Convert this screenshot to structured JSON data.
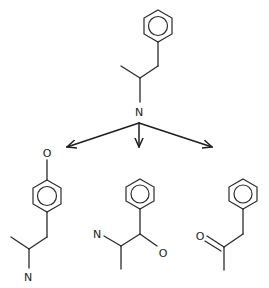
{
  "diagram": {
    "parent": {
      "name": "amphetamine",
      "atoms": [
        {
          "label": "N"
        }
      ]
    },
    "products": [
      {
        "name": "4-hydroxyamphetamine",
        "atoms": [
          {
            "label": "O"
          },
          {
            "label": "N"
          }
        ]
      },
      {
        "name": "norephedrine",
        "atoms": [
          {
            "label": "N"
          },
          {
            "label": "O"
          }
        ]
      },
      {
        "name": "phenylacetone",
        "atoms": [
          {
            "label": "O"
          }
        ]
      }
    ],
    "arrows": [
      "left",
      "down",
      "right"
    ],
    "colors": {
      "line": "#2a2a2a",
      "background": "#ffffff"
    }
  }
}
